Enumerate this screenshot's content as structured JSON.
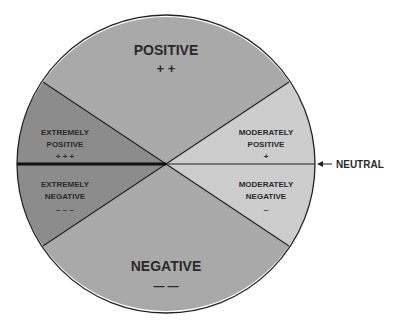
{
  "diagram": {
    "type": "attitude-wheel",
    "segments": {
      "positive": {
        "title": "POSITIVE",
        "symbol": "+ +",
        "color": "#a9a9a9"
      },
      "negative": {
        "title": "NEGATIVE",
        "symbol": "— —",
        "color": "#a9a9a9"
      },
      "extremely_positive": {
        "line1": "EXTREMELY",
        "line2": "POSITIVE",
        "symbol": "+ + +",
        "color": "#8c8c8c"
      },
      "extremely_negative": {
        "line1": "EXTREMELY",
        "line2": "NEGATIVE",
        "symbol": "– – –",
        "color": "#8c8c8c"
      },
      "moderately_positive": {
        "line1": "MODERATELY",
        "line2": "POSITIVE",
        "symbol": "+",
        "color": "#cdcdcd"
      },
      "moderately_negative": {
        "line1": "MODERATELY",
        "line2": "NEGATIVE",
        "symbol": "–",
        "color": "#cdcdcd"
      }
    },
    "neutral_label": "NEUTRAL"
  }
}
